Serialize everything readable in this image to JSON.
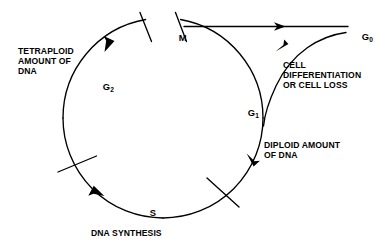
{
  "diagram": {
    "stroke_color": "#000000",
    "background_color": "#ffffff",
    "phases": [
      {
        "id": "m",
        "label": "M",
        "sub": "",
        "description": "Mitosis phase at top of cycle"
      },
      {
        "id": "g1",
        "label": "G",
        "sub": "1",
        "description": "Gap 1 phase on right of cycle"
      },
      {
        "id": "s",
        "label": "S",
        "sub": "",
        "description": "Synthesis phase at bottom of cycle"
      },
      {
        "id": "g2",
        "label": "G",
        "sub": "2",
        "description": "Gap 2 phase on left of cycle"
      },
      {
        "id": "g0",
        "label": "G",
        "sub": "0",
        "description": "Quiescent phase outside cycle"
      }
    ],
    "annotations": {
      "tetraploid": "TETRAPLOID\nAMOUNT OF\nDNA",
      "cell_differentiation": "CELL\nDIFFERENTIATION\nOR CELL LOSS",
      "diploid": "DIPLOID AMOUNT\nOF DNA",
      "dna_synthesis": "DNA SYNTHESIS"
    }
  }
}
